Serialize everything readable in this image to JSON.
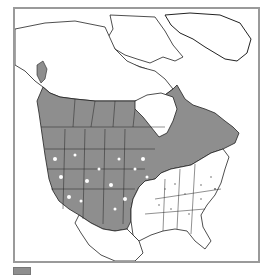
{
  "map": {
    "subject": "Species range map of North America",
    "region": "North America (Canada, United States, Mexico, Greenland)",
    "colors": {
      "range_fill": "#8e8e8e",
      "land_outline": "#222222",
      "frame_border": "#9a9a9a",
      "background": "#ffffff"
    },
    "shaded_regions": [
      "Southeast Alaska",
      "British Columbia",
      "Alberta",
      "Saskatchewan",
      "Manitoba",
      "Ontario",
      "Quebec",
      "Labrador",
      "New Brunswick",
      "Nova Scotia",
      "Western United States",
      "Great Plains",
      "Upper Midwest"
    ],
    "unshaded_regions": [
      "Northern Alaska",
      "Yukon",
      "Northwest Territories",
      "Nunavut",
      "Arctic islands",
      "Greenland",
      "Southeastern United States",
      "Mexico"
    ]
  },
  "legend": {
    "swatch_color": "#8e8e8e",
    "label": ""
  }
}
